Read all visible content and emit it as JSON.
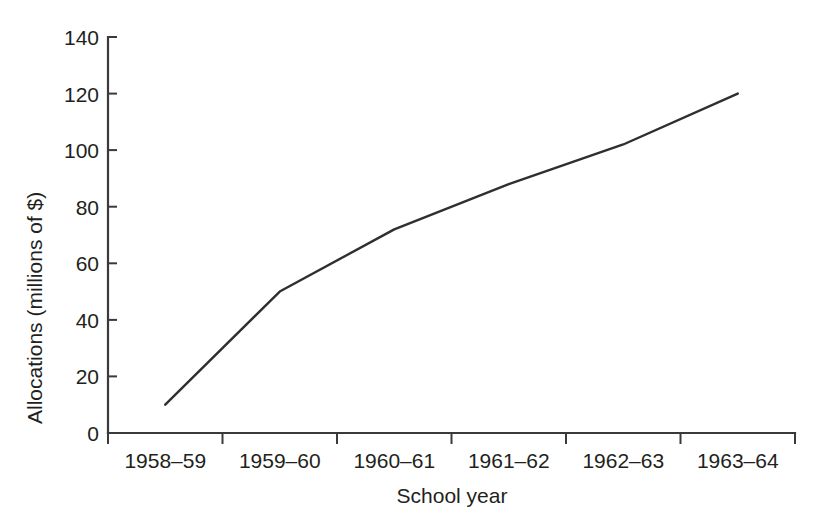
{
  "chart_data": {
    "type": "line",
    "title": "",
    "subtitle": "",
    "xlabel": "School year",
    "ylabel": "Allocations (millions of $)",
    "categories": [
      "1958–59",
      "1959–60",
      "1960–61",
      "1961–62",
      "1962–63",
      "1963–64"
    ],
    "values": [
      10,
      50,
      72,
      88,
      102,
      120
    ],
    "series": [
      {
        "name": "Allocations",
        "values": [
          10,
          50,
          72,
          88,
          102,
          120
        ]
      }
    ],
    "ylim": [
      0,
      140
    ],
    "ytick_labels": [
      "0",
      "20",
      "40",
      "60",
      "80",
      "100",
      "120",
      "140"
    ],
    "ytick_values": [
      0,
      20,
      40,
      60,
      80,
      100,
      120,
      140
    ],
    "xtick_labels": [
      "1958–59",
      "1959–60",
      "1960–61",
      "1961–62",
      "1962–63",
      "1963–64"
    ],
    "grid": false,
    "legend": false,
    "legend_position": "none",
    "line_color": "#2f2f33",
    "axis_color": "#3a3a3a",
    "background_color": "#ffffff",
    "markers": false,
    "annotations": []
  },
  "axes": {
    "y_axis_title": "Allocations (millions of $)",
    "x_axis_title": "School year"
  }
}
